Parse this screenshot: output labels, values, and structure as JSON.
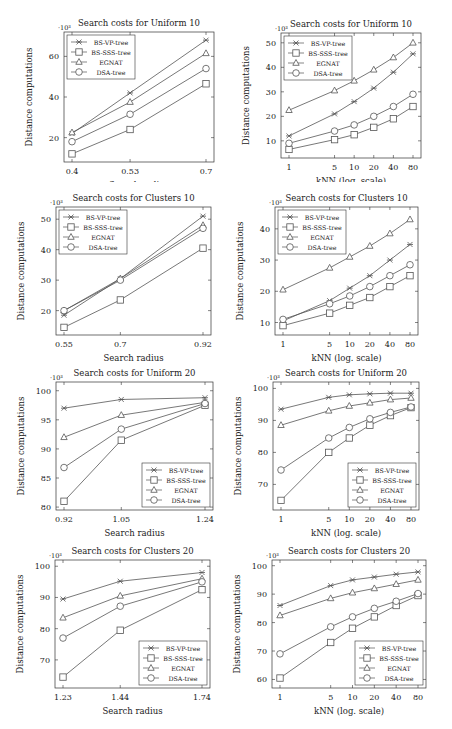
{
  "legend_series": [
    "BS-VP-tree",
    "BS-SSS-tree",
    "EGNAT",
    "DSA-tree"
  ],
  "markers": {
    "BS-VP-tree": "star",
    "BS-SSS-tree": "square",
    "EGNAT": "triangle",
    "DSA-tree": "circle"
  },
  "colors": {
    "line": "#555555",
    "frame": "#333333",
    "text": "#222222",
    "background": "#ffffff"
  },
  "chart_data": [
    {
      "id": "uniform10-radius",
      "type": "line",
      "title": "Search costs for Uniform 10",
      "xlabel": "Search radius",
      "ylabel": "Distance computations",
      "yscale_label": "·10³",
      "categories": [
        "0.4",
        "0.53",
        "0.7"
      ],
      "x": [
        0.4,
        0.53,
        0.7
      ],
      "xscale": "linear",
      "ylim": [
        8,
        72
      ],
      "yticks": [
        20,
        40,
        60
      ],
      "legend_position": "upper-left",
      "series": [
        {
          "name": "BS-VP-tree",
          "values": [
            22,
            42,
            68
          ]
        },
        {
          "name": "BS-SSS-tree",
          "values": [
            12,
            24,
            46.5
          ]
        },
        {
          "name": "EGNAT",
          "values": [
            22.5,
            37.5,
            61.5
          ]
        },
        {
          "name": "DSA-tree",
          "values": [
            18,
            31.5,
            54
          ]
        }
      ]
    },
    {
      "id": "uniform10-knn",
      "type": "line",
      "title": "Search costs for Uniform 10",
      "xlabel": "kNN (log. scale)",
      "ylabel": "Distance computations",
      "yscale_label": "·10³",
      "categories": [
        "1",
        "5",
        "10",
        "20",
        "40",
        "80"
      ],
      "x": [
        1,
        5,
        10,
        20,
        40,
        80
      ],
      "xscale": "log",
      "ylim": [
        3,
        54
      ],
      "yticks": [
        10,
        20,
        30,
        40,
        50
      ],
      "legend_position": "upper-left",
      "series": [
        {
          "name": "BS-VP-tree",
          "values": [
            12,
            21,
            26,
            31.5,
            38,
            45.5
          ]
        },
        {
          "name": "BS-SSS-tree",
          "values": [
            6.5,
            10.5,
            12.5,
            15.5,
            19,
            24
          ]
        },
        {
          "name": "EGNAT",
          "values": [
            22.5,
            30.5,
            34.5,
            39,
            44,
            50
          ]
        },
        {
          "name": "DSA-tree",
          "values": [
            9,
            14,
            16.5,
            20,
            24,
            29
          ]
        }
      ]
    },
    {
      "id": "clusters10-radius",
      "type": "line",
      "title": "Search costs for Clusters 10",
      "xlabel": "Search radius",
      "ylabel": "Distance computations",
      "yscale_label": "·10³",
      "categories": [
        "0.55",
        "0.7",
        "0.92"
      ],
      "x": [
        0.55,
        0.7,
        0.92
      ],
      "xscale": "linear",
      "ylim": [
        12,
        54
      ],
      "yticks": [
        20,
        30,
        40,
        50
      ],
      "legend_position": "upper-left",
      "series": [
        {
          "name": "BS-VP-tree",
          "values": [
            18.5,
            30.5,
            51
          ]
        },
        {
          "name": "BS-SSS-tree",
          "values": [
            14.5,
            23.5,
            40.5
          ]
        },
        {
          "name": "EGNAT",
          "values": [
            20,
            30.5,
            48
          ]
        },
        {
          "name": "DSA-tree",
          "values": [
            20,
            30,
            47
          ]
        }
      ]
    },
    {
      "id": "clusters10-knn",
      "type": "line",
      "title": "Search costs for Clusters 10",
      "xlabel": "kNN (log. scale)",
      "ylabel": "Distance computations",
      "yscale_label": "·10³",
      "categories": [
        "1",
        "5",
        "10",
        "20",
        "40",
        "80"
      ],
      "x": [
        1,
        5,
        10,
        20,
        40,
        80
      ],
      "xscale": "log",
      "ylim": [
        6,
        47
      ],
      "yticks": [
        10,
        20,
        30,
        40
      ],
      "legend_position": "upper-left",
      "series": [
        {
          "name": "BS-VP-tree",
          "values": [
            10.5,
            17,
            21,
            25,
            30,
            35
          ]
        },
        {
          "name": "BS-SSS-tree",
          "values": [
            9,
            13,
            15.5,
            18,
            21.5,
            25
          ]
        },
        {
          "name": "EGNAT",
          "values": [
            20.5,
            27.5,
            31,
            34.5,
            38.5,
            43
          ]
        },
        {
          "name": "DSA-tree",
          "values": [
            11,
            16,
            18.5,
            21.5,
            25,
            28.5
          ]
        }
      ]
    },
    {
      "id": "uniform20-radius",
      "type": "line",
      "title": "Search costs for Uniform 20",
      "xlabel": "Search radius",
      "ylabel": "Distance computations",
      "yscale_label": "·10³",
      "categories": [
        "0.92",
        "1.05",
        "1.24"
      ],
      "x": [
        0.92,
        1.05,
        1.24
      ],
      "xscale": "linear",
      "ylim": [
        79.5,
        101.5
      ],
      "yticks": [
        80,
        85,
        90,
        95,
        100
      ],
      "legend_position": "lower-right",
      "series": [
        {
          "name": "BS-VP-tree",
          "values": [
            97,
            98.5,
            98.8
          ]
        },
        {
          "name": "BS-SSS-tree",
          "values": [
            81,
            91.5,
            97.5
          ]
        },
        {
          "name": "EGNAT",
          "values": [
            92,
            95.8,
            98
          ]
        },
        {
          "name": "DSA-tree",
          "values": [
            86.8,
            93.4,
            97.8
          ]
        }
      ]
    },
    {
      "id": "uniform20-knn",
      "type": "line",
      "title": "Search costs for Uniform 20",
      "xlabel": "kNN (log. scale)",
      "ylabel": "Distance computations",
      "yscale_label": "·10³",
      "categories": [
        "1",
        "5",
        "10",
        "20",
        "40",
        "80"
      ],
      "x": [
        1,
        5,
        10,
        20,
        40,
        80
      ],
      "xscale": "log",
      "ylim": [
        62,
        102
      ],
      "yticks": [
        70,
        80,
        90,
        100
      ],
      "legend_position": "lower-right",
      "series": [
        {
          "name": "BS-VP-tree",
          "values": [
            93.5,
            97.2,
            98,
            98.3,
            98.5,
            98.5
          ]
        },
        {
          "name": "BS-SSS-tree",
          "values": [
            65,
            80,
            84.5,
            88.5,
            91.5,
            94
          ]
        },
        {
          "name": "EGNAT",
          "values": [
            88.5,
            93,
            94.5,
            95.5,
            96.5,
            97
          ]
        },
        {
          "name": "DSA-tree",
          "values": [
            74.5,
            84.5,
            87.8,
            90.5,
            92.5,
            94.2
          ]
        }
      ]
    },
    {
      "id": "clusters20-radius",
      "type": "line",
      "title": "Search costs for Clusters 20",
      "xlabel": "Search radius",
      "ylabel": "Distance computations",
      "yscale_label": "·10³",
      "categories": [
        "1.23",
        "1.44",
        "1.74"
      ],
      "x": [
        1.23,
        1.44,
        1.74
      ],
      "xscale": "linear",
      "ylim": [
        61,
        102
      ],
      "yticks": [
        70,
        80,
        90,
        100
      ],
      "legend_position": "lower-right",
      "series": [
        {
          "name": "BS-VP-tree",
          "values": [
            89.5,
            95.2,
            98
          ]
        },
        {
          "name": "BS-SSS-tree",
          "values": [
            64.5,
            79.5,
            92.5
          ]
        },
        {
          "name": "EGNAT",
          "values": [
            83.5,
            90.5,
            96
          ]
        },
        {
          "name": "DSA-tree",
          "values": [
            77,
            87.2,
            95
          ]
        }
      ]
    },
    {
      "id": "clusters20-knn",
      "type": "line",
      "title": "Search costs for Clusters 20",
      "xlabel": "kNN (log. scale)",
      "ylabel": "Distance computations",
      "yscale_label": "·10³",
      "categories": [
        "1",
        "5",
        "10",
        "20",
        "40",
        "80"
      ],
      "x": [
        1,
        5,
        10,
        20,
        40,
        80
      ],
      "xscale": "log",
      "ylim": [
        57,
        102
      ],
      "yticks": [
        60,
        70,
        80,
        90,
        100
      ],
      "legend_position": "lower-right",
      "series": [
        {
          "name": "BS-VP-tree",
          "values": [
            86,
            93,
            95,
            96,
            97,
            97.8
          ]
        },
        {
          "name": "BS-SSS-tree",
          "values": [
            60.5,
            73,
            78,
            82,
            86,
            89.5
          ]
        },
        {
          "name": "EGNAT",
          "values": [
            82.5,
            88.5,
            90.5,
            92,
            93.5,
            95
          ]
        },
        {
          "name": "DSA-tree",
          "values": [
            69,
            78.5,
            82,
            85,
            87.5,
            90.2
          ]
        }
      ]
    }
  ],
  "layout": [
    {
      "left": 0,
      "top": 0,
      "fl": 64,
      "ft": 32,
      "fw": 150,
      "fh": 130
    },
    {
      "left": 226,
      "top": 0,
      "fl": 55,
      "ft": 33,
      "fw": 140,
      "fh": 125
    },
    {
      "left": 0,
      "top": 185,
      "fl": 56,
      "ft": 22,
      "fw": 155,
      "fh": 128
    },
    {
      "left": 226,
      "top": 185,
      "fl": 49,
      "ft": 22,
      "fw": 143,
      "fh": 128
    },
    {
      "left": 0,
      "top": 365,
      "fl": 56,
      "ft": 17,
      "fw": 157,
      "fh": 128
    },
    {
      "left": 226,
      "top": 365,
      "fl": 47,
      "ft": 17,
      "fw": 146,
      "fh": 128
    },
    {
      "left": 0,
      "top": 543,
      "fl": 55,
      "ft": 17,
      "fw": 155,
      "fh": 128
    },
    {
      "left": 226,
      "top": 543,
      "fl": 46,
      "ft": 17,
      "fw": 154,
      "fh": 128
    }
  ]
}
